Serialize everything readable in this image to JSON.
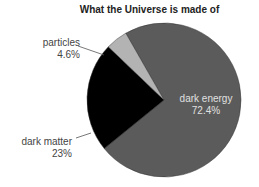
{
  "chart_data": {
    "type": "pie",
    "title": "What the Universe is made of",
    "slices": [
      {
        "label": "dark energy",
        "value": 72.4,
        "display": "72.4%",
        "color": "#5b5b5b"
      },
      {
        "label": "dark matter",
        "value": 23,
        "display": "23%",
        "color": "#000000"
      },
      {
        "label": "particles",
        "value": 4.6,
        "display": "4.6%",
        "color": "#b3b3b3"
      }
    ],
    "legend": "none",
    "labels": "callout"
  }
}
